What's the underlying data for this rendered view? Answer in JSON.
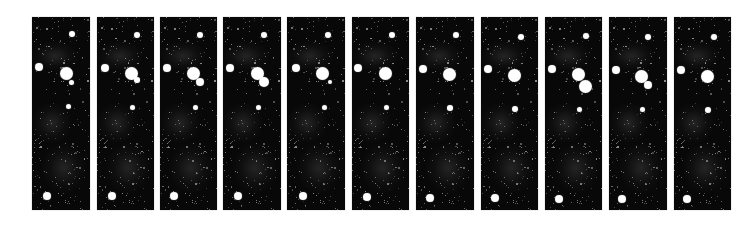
{
  "figure": {
    "panel_count": 11,
    "panel_top": 17,
    "panel_height": 193,
    "background_color": "#080808",
    "object_color": "#ffffff",
    "page_background": "#ffffff"
  },
  "panels": [
    {
      "index": 1,
      "left": 32,
      "width": 58,
      "objects": [
        {
          "type": "star",
          "x": 72,
          "y": 34,
          "r": 3
        },
        {
          "type": "star",
          "x": 39,
          "y": 67,
          "r": 4
        },
        {
          "type": "planet",
          "x": 66,
          "y": 73,
          "r": 6.5
        },
        {
          "type": "moon",
          "x": 71,
          "y": 82,
          "r": 2.5
        },
        {
          "type": "star",
          "x": 68,
          "y": 106,
          "r": 2.5
        },
        {
          "type": "star",
          "x": 47,
          "y": 196,
          "r": 4
        }
      ]
    },
    {
      "index": 2,
      "left": 97,
      "width": 57,
      "objects": [
        {
          "type": "star",
          "x": 137,
          "y": 35,
          "r": 3
        },
        {
          "type": "star",
          "x": 105,
          "y": 68,
          "r": 4
        },
        {
          "type": "planet",
          "x": 131,
          "y": 73,
          "r": 6.5
        },
        {
          "type": "moon",
          "x": 137,
          "y": 80,
          "r": 2.8
        },
        {
          "type": "star",
          "x": 132,
          "y": 107,
          "r": 2.5
        },
        {
          "type": "star",
          "x": 112,
          "y": 196,
          "r": 4
        }
      ]
    },
    {
      "index": 3,
      "left": 160,
      "width": 57,
      "objects": [
        {
          "type": "star",
          "x": 200,
          "y": 35,
          "r": 3
        },
        {
          "type": "star",
          "x": 167,
          "y": 68,
          "r": 4
        },
        {
          "type": "planet",
          "x": 193,
          "y": 73,
          "r": 6.5
        },
        {
          "type": "moon",
          "x": 200,
          "y": 82,
          "r": 4
        },
        {
          "type": "star",
          "x": 195,
          "y": 107,
          "r": 2.5
        },
        {
          "type": "star",
          "x": 174,
          "y": 196,
          "r": 4
        }
      ]
    },
    {
      "index": 4,
      "left": 223,
      "width": 58,
      "objects": [
        {
          "type": "star",
          "x": 264,
          "y": 35,
          "r": 3
        },
        {
          "type": "star",
          "x": 230,
          "y": 68,
          "r": 4
        },
        {
          "type": "planet",
          "x": 257,
          "y": 73,
          "r": 6.5
        },
        {
          "type": "moon",
          "x": 264,
          "y": 82,
          "r": 5
        },
        {
          "type": "star",
          "x": 258,
          "y": 107,
          "r": 2.5
        },
        {
          "type": "star",
          "x": 238,
          "y": 196,
          "r": 4
        }
      ]
    },
    {
      "index": 5,
      "left": 287,
      "width": 58,
      "objects": [
        {
          "type": "star",
          "x": 328,
          "y": 35,
          "r": 3
        },
        {
          "type": "star",
          "x": 296,
          "y": 68,
          "r": 4
        },
        {
          "type": "planet",
          "x": 322,
          "y": 73,
          "r": 6.5
        },
        {
          "type": "moon",
          "x": 330,
          "y": 82,
          "r": 2
        },
        {
          "type": "star",
          "x": 324,
          "y": 107,
          "r": 2.5
        },
        {
          "type": "star",
          "x": 303,
          "y": 196,
          "r": 4
        }
      ]
    },
    {
      "index": 6,
      "left": 352,
      "width": 57,
      "objects": [
        {
          "type": "star",
          "x": 392,
          "y": 35,
          "r": 3
        },
        {
          "type": "star",
          "x": 358,
          "y": 68,
          "r": 4
        },
        {
          "type": "planet",
          "x": 385,
          "y": 73,
          "r": 6.5
        },
        {
          "type": "star",
          "x": 386,
          "y": 107,
          "r": 2.5
        },
        {
          "type": "star",
          "x": 367,
          "y": 197,
          "r": 4
        }
      ]
    },
    {
      "index": 7,
      "left": 416,
      "width": 58,
      "objects": [
        {
          "type": "star",
          "x": 456,
          "y": 35,
          "r": 3
        },
        {
          "type": "star",
          "x": 423,
          "y": 69,
          "r": 4
        },
        {
          "type": "planet",
          "x": 449,
          "y": 74,
          "r": 6.5
        },
        {
          "type": "star",
          "x": 450,
          "y": 108,
          "r": 2.8
        },
        {
          "type": "star",
          "x": 430,
          "y": 198,
          "r": 4
        }
      ]
    },
    {
      "index": 8,
      "left": 481,
      "width": 57,
      "objects": [
        {
          "type": "star",
          "x": 521,
          "y": 37,
          "r": 3
        },
        {
          "type": "star",
          "x": 488,
          "y": 69,
          "r": 4
        },
        {
          "type": "planet",
          "x": 514,
          "y": 75,
          "r": 6.5
        },
        {
          "type": "star",
          "x": 515,
          "y": 109,
          "r": 3
        },
        {
          "type": "star",
          "x": 495,
          "y": 198,
          "r": 4
        }
      ]
    },
    {
      "index": 9,
      "left": 545,
      "width": 57,
      "objects": [
        {
          "type": "star",
          "x": 586,
          "y": 36,
          "r": 3
        },
        {
          "type": "star",
          "x": 552,
          "y": 69,
          "r": 4
        },
        {
          "type": "planet",
          "x": 578,
          "y": 74,
          "r": 6.5
        },
        {
          "type": "moon",
          "x": 585,
          "y": 86,
          "r": 6.5
        },
        {
          "type": "star",
          "x": 579,
          "y": 109,
          "r": 2.5
        },
        {
          "type": "star",
          "x": 559,
          "y": 199,
          "r": 4
        }
      ]
    },
    {
      "index": 10,
      "left": 609,
      "width": 58,
      "objects": [
        {
          "type": "star",
          "x": 648,
          "y": 37,
          "r": 3
        },
        {
          "type": "star",
          "x": 616,
          "y": 70,
          "r": 4
        },
        {
          "type": "planet",
          "x": 641,
          "y": 76,
          "r": 6.5
        },
        {
          "type": "moon",
          "x": 648,
          "y": 85,
          "r": 4
        },
        {
          "type": "star",
          "x": 642,
          "y": 109,
          "r": 2.5
        },
        {
          "type": "star",
          "x": 622,
          "y": 199,
          "r": 4
        }
      ]
    },
    {
      "index": 11,
      "left": 674,
      "width": 57,
      "objects": [
        {
          "type": "star",
          "x": 714,
          "y": 37,
          "r": 3
        },
        {
          "type": "star",
          "x": 681,
          "y": 70,
          "r": 4
        },
        {
          "type": "planet",
          "x": 707,
          "y": 76,
          "r": 6.5
        },
        {
          "type": "star",
          "x": 708,
          "y": 110,
          "r": 3
        },
        {
          "type": "star",
          "x": 687,
          "y": 199,
          "r": 4
        }
      ]
    }
  ]
}
